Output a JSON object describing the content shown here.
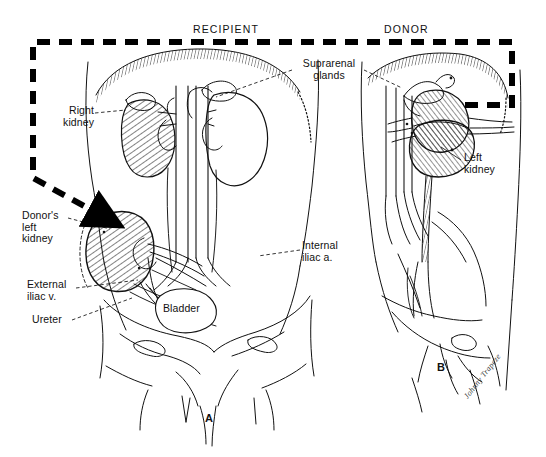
{
  "figure": {
    "type": "medical-illustration",
    "background": "#ffffff",
    "ink": "#111111"
  },
  "headers": [
    {
      "id": "recipient",
      "text": "RECIPIENT",
      "x": 193,
      "y": 23
    },
    {
      "id": "donor",
      "text": "DONOR",
      "x": 384,
      "y": 23
    }
  ],
  "panel_ids": [
    {
      "id": "panel-a",
      "text": "A",
      "x": 205,
      "y": 412
    },
    {
      "id": "panel-b",
      "text": "B",
      "x": 437,
      "y": 366
    }
  ],
  "signature": {
    "text": "Johnny Trapeze",
    "x": 462,
    "y": 363
  },
  "labels": [
    {
      "id": "right-kidney",
      "text": "Right\nkidney",
      "x": 78,
      "y": 111,
      "align": "right"
    },
    {
      "id": "donors-left-kidney",
      "text": "Donor's\nleft\nkidney",
      "x": 24,
      "y": 212,
      "align": "left"
    },
    {
      "id": "external-iliac-v",
      "text": "External\niliac v.",
      "x": 28,
      "y": 282,
      "align": "left"
    },
    {
      "id": "ureter",
      "text": "Ureter",
      "x": 33,
      "y": 317,
      "align": "left"
    },
    {
      "id": "suprarenal-glands",
      "text": "Suprarenal\nglands",
      "x": 297,
      "y": 62,
      "align": "left"
    },
    {
      "id": "internal-iliac-a",
      "text": "Internal\niliac a.",
      "x": 303,
      "y": 244,
      "align": "left"
    },
    {
      "id": "bladder",
      "text": "Bladder",
      "x": 163,
      "y": 306,
      "align": "left"
    },
    {
      "id": "left-kidney",
      "text": "Left\nkidney",
      "x": 464,
      "y": 155,
      "align": "left"
    }
  ],
  "transfer_arrow": {
    "id": "transfer-path",
    "style": "bold-dashed-with-arrowhead",
    "dash": "13 9",
    "width": 6,
    "color": "#000000",
    "description": "Path from donor left kidney rightwards to right margin, up to top margin, left across the top, down the left margin, then diagonally to the recipient left iliac fossa",
    "points": "465,105 512,105 512,42 33,42 33,178 100,214"
  },
  "leader_lines": [
    {
      "id": "leader-right-kidney",
      "path": "95,113 126,111"
    },
    {
      "id": "leader-donors-kidney",
      "path": "68,218 112,228"
    },
    {
      "id": "leader-external-iliac",
      "path": "74,288 135,281"
    },
    {
      "id": "leader-ureter",
      "path": "70,320 130,299"
    },
    {
      "id": "leader-suprarenal-left",
      "path": "292,70 218,96"
    },
    {
      "id": "leader-suprarenal-right",
      "path": "366,70 400,86"
    },
    {
      "id": "leader-internal-iliac",
      "path": "300,250 262,258"
    },
    {
      "id": "leader-left-kidney",
      "path": "461,159 440,148"
    }
  ],
  "anatomy": {
    "recipient": [
      "torso-outline",
      "right-kidney-hatched",
      "left-native-kidney",
      "aorta",
      "inferior-vena-cava",
      "renal-vessels",
      "native-ureters",
      "bladder",
      "pelvic-bones",
      "transplanted-kidney-hatched",
      "external-iliac-vein",
      "internal-iliac-artery",
      "transplant-ureter",
      "diaphragm-hatched"
    ],
    "donor": [
      "torso-outline",
      "mobilized-left-kidney",
      "suprarenal-gland",
      "aorta",
      "inferior-vena-cava",
      "renal-artery",
      "renal-vein",
      "left-ureter",
      "pelvic-bones",
      "diaphragm-hatched"
    ]
  }
}
